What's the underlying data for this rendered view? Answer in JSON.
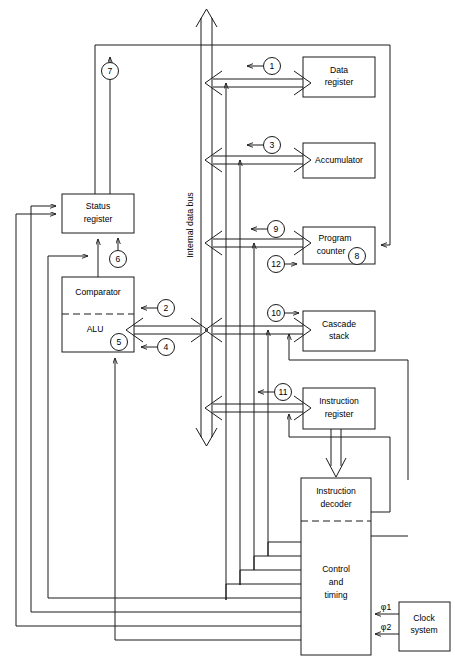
{
  "figure": {
    "type": "block-diagram",
    "bus_label": "Internal data bus"
  },
  "blocks": [
    {
      "id": "data-register",
      "label_lines": [
        "Data",
        "register"
      ],
      "x": 303,
      "y": 57,
      "w": 72,
      "h": 40
    },
    {
      "id": "accumulator",
      "label_lines": [
        "Accumulator"
      ],
      "x": 303,
      "y": 143,
      "w": 72,
      "h": 35
    },
    {
      "id": "program-counter",
      "label_lines": [
        "Program",
        "counter"
      ],
      "x": 303,
      "y": 227,
      "w": 72,
      "h": 37
    },
    {
      "id": "cascade-stack",
      "label_lines": [
        "Cascade",
        "stack"
      ],
      "x": 303,
      "y": 311,
      "w": 72,
      "h": 40
    },
    {
      "id": "instruction-register",
      "label_lines": [
        "Instruction",
        "register"
      ],
      "x": 303,
      "y": 388,
      "w": 72,
      "h": 41
    },
    {
      "id": "instruction-decoder",
      "label_lines": [
        "Instruction",
        "decoder"
      ],
      "x": 301,
      "y": 478,
      "w": 70,
      "h": 43
    },
    {
      "id": "control-timing",
      "label_lines": [
        "Control",
        "and",
        "timing"
      ],
      "x": 301,
      "y": 521,
      "w": 70,
      "h": 134
    },
    {
      "id": "clock-system",
      "label_lines": [
        "Clock",
        "system"
      ],
      "x": 399,
      "y": 602,
      "w": 51,
      "h": 49
    },
    {
      "id": "status-register",
      "label_lines": [
        "Status",
        "register"
      ],
      "x": 62,
      "y": 194,
      "w": 72,
      "h": 39
    },
    {
      "id": "comparator",
      "label_lines": [
        "Comparator"
      ],
      "x": 62,
      "y": 277,
      "w": 72,
      "h": 37
    },
    {
      "id": "alu",
      "label_lines": [
        "ALU"
      ],
      "x": 62,
      "y": 314,
      "w": 72,
      "h": 38
    }
  ],
  "callouts": [
    {
      "n": "1",
      "cx": 272,
      "cy": 66
    },
    {
      "n": "2",
      "cx": 166,
      "cy": 308
    },
    {
      "n": "3",
      "cx": 272,
      "cy": 145
    },
    {
      "n": "4",
      "cx": 166,
      "cy": 347
    },
    {
      "n": "5",
      "cx": 119,
      "cy": 342
    },
    {
      "n": "6",
      "cx": 118,
      "cy": 259
    },
    {
      "n": "7",
      "cx": 110,
      "cy": 71
    },
    {
      "n": "8",
      "cx": 357,
      "cy": 256
    },
    {
      "n": "9",
      "cx": 276,
      "cy": 229
    },
    {
      "n": "10",
      "cx": 276,
      "cy": 313
    },
    {
      "n": "11",
      "cx": 283,
      "cy": 392
    },
    {
      "n": "12",
      "cx": 276,
      "cy": 264
    }
  ],
  "clock_signals": [
    {
      "name": "φ1",
      "x": 386,
      "y": 614
    },
    {
      "name": "φ2",
      "x": 386,
      "y": 634
    }
  ],
  "colors": {
    "stroke": "#1a1a1a",
    "background": "#ffffff",
    "text": "#000000"
  }
}
